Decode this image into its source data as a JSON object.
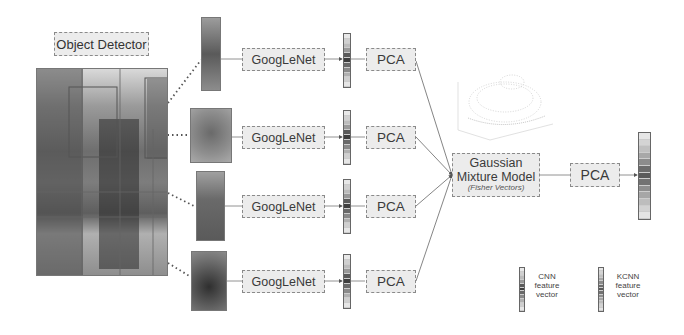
{
  "title": "Object Detector",
  "rows": [
    {
      "crop": "tree-crop",
      "network": "GoogLeNet",
      "reduction": "PCA"
    },
    {
      "crop": "giraffe-head-crop",
      "network": "GoogLeNet",
      "reduction": "PCA"
    },
    {
      "crop": "giraffe-body-crop",
      "network": "GoogLeNet",
      "reduction": "PCA"
    },
    {
      "crop": "person-crop",
      "network": "GoogLeNet",
      "reduction": "PCA"
    }
  ],
  "gmm": {
    "title_line1": "Gaussian",
    "title_line2": "Mixture Model",
    "subtitle": "(Fisher Vectors)"
  },
  "final_reduction": "PCA",
  "legend": {
    "cnn": {
      "line1": "CNN",
      "line2": "feature",
      "line3": "vector"
    },
    "kcnn": {
      "line1": "KCNN",
      "line2": "feature",
      "line3": "vector"
    }
  },
  "plot_caption": "3D scatter of descriptors",
  "colors": {
    "box_fill": "#ececec",
    "box_border": "#8a8a8a",
    "line": "#666666"
  }
}
